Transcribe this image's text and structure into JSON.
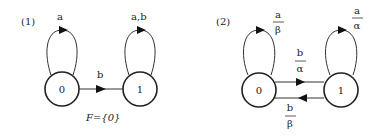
{
  "diagram1": {
    "panel_label": "(1)",
    "states": [
      {
        "id": "0",
        "label": "0"
      },
      {
        "id": "1",
        "label": "1"
      }
    ],
    "transitions": [
      {
        "from": "0",
        "to": "0",
        "label": "a"
      },
      {
        "from": "1",
        "to": "1",
        "label": "a,b"
      },
      {
        "from": "0",
        "to": "1",
        "label": "b"
      }
    ],
    "final_set_label": "F={0}"
  },
  "diagram2": {
    "panel_label": "(2)",
    "states": [
      {
        "id": "0",
        "label": "0"
      },
      {
        "id": "1",
        "label": "1"
      }
    ],
    "transitions": [
      {
        "from": "0",
        "to": "0",
        "input": "a",
        "output": "β"
      },
      {
        "from": "1",
        "to": "1",
        "input": "a",
        "output": "α"
      },
      {
        "from": "0",
        "to": "1",
        "input": "b",
        "output": "α"
      },
      {
        "from": "1",
        "to": "0",
        "input": "b",
        "output": "β"
      }
    ]
  }
}
